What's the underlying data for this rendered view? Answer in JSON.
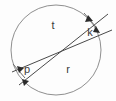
{
  "figure": {
    "name": "circle-with-two-secants",
    "background_color": "#fdfdfd",
    "width": 116,
    "height": 101,
    "circle": {
      "label": "circle-outline",
      "center_x": 56,
      "center_y": 50,
      "radius": 45,
      "stroke_color": "#8f8f8f",
      "stroke_width": 1
    },
    "lines": [
      {
        "name": "secant-upper",
        "x1": 12,
        "y1": 72,
        "x2": 112,
        "y2": 30,
        "stroke_color": "#4a4a4a"
      },
      {
        "name": "secant-lower",
        "x1": 19,
        "y1": 85,
        "x2": 108,
        "y2": 14,
        "stroke_color": "#4a4a4a"
      }
    ],
    "labels": [
      {
        "name": "label-t",
        "text": "t",
        "x": 53,
        "y": 26
      },
      {
        "name": "label-r",
        "text": "r",
        "x": 68,
        "y": 70
      },
      {
        "name": "label-k",
        "text": "k",
        "x": 90,
        "y": 33
      },
      {
        "name": "label-p",
        "text": "p",
        "x": 27,
        "y": 70
      }
    ],
    "arrows": [
      {
        "name": "arrow-top-right-down",
        "x": 88,
        "y": 19,
        "angle": 125
      },
      {
        "name": "arrow-right-down",
        "x": 96,
        "y": 30,
        "angle": 100
      },
      {
        "name": "arrow-left-p-right",
        "x": 20,
        "y": 69,
        "angle": -55
      },
      {
        "name": "arrow-left-lower-right",
        "x": 26,
        "y": 82,
        "angle": -60
      }
    ],
    "ticks": [
      {
        "name": "tick-upper-right",
        "x1": 84,
        "y1": 14,
        "x2": 95,
        "y2": 26
      },
      {
        "name": "tick-lower-left",
        "x1": 13,
        "y1": 65,
        "x2": 24,
        "y2": 77
      }
    ],
    "accent_color": "#2b2b2b"
  }
}
